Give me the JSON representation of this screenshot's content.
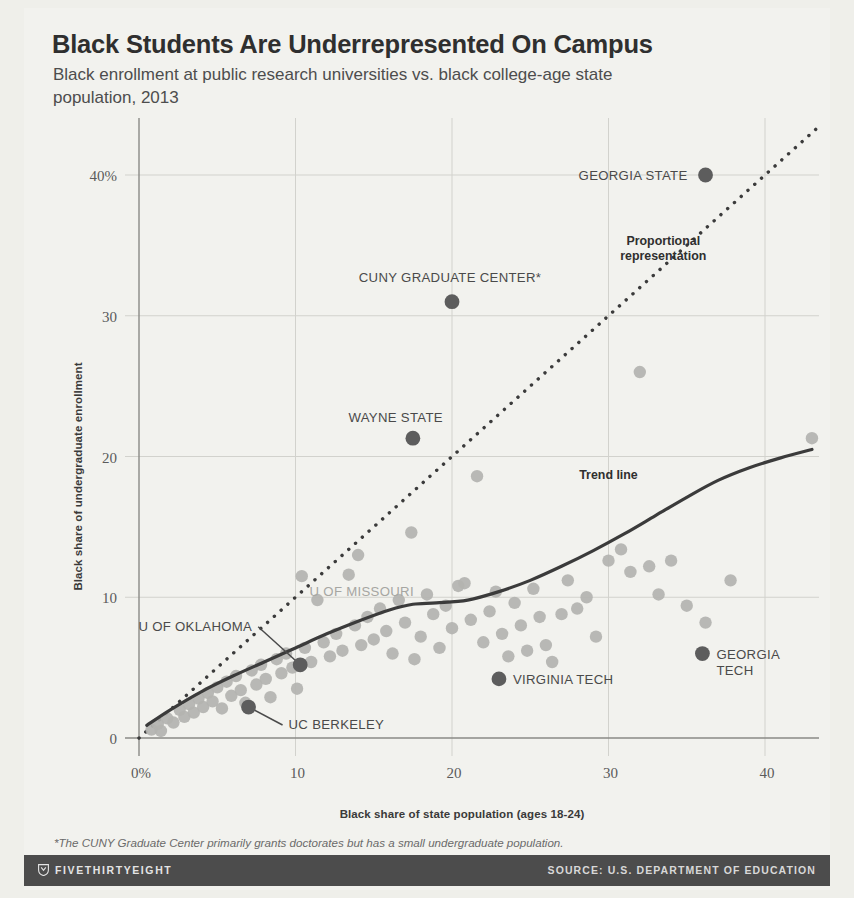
{
  "header": {
    "title": "Black Students Are Underrepresented On Campus",
    "subtitle": "Black enrollment at public research universities vs. black college-age state population, 2013"
  },
  "footnote": "*The CUNY Graduate Center primarily grants doctorates but has a small undergraduate population.",
  "footer": {
    "brand": "FIVETHIRTYEIGHT",
    "source": "SOURCE: U.S. DEPARTMENT OF EDUCATION",
    "logo_icon": "shield-icon",
    "bar_color": "#4c4c4c"
  },
  "chart_data": {
    "type": "scatter",
    "title": "Black Students Are Underrepresented On Campus",
    "subtitle": "Black enrollment at public research universities vs. black college-age state population, 2013",
    "xlabel": "Black share of state population (ages 18-24)",
    "ylabel": "Black share of undergraduate enrollment",
    "xlim": [
      0,
      45
    ],
    "ylim": [
      0,
      43
    ],
    "xticks": [
      0,
      10,
      20,
      30,
      40
    ],
    "xtick_labels": [
      "0%",
      "10",
      "20",
      "30",
      "40"
    ],
    "yticks": [
      0,
      10,
      20,
      30,
      40
    ],
    "ytick_labels": [
      "0",
      "10",
      "20",
      "30",
      "40%"
    ],
    "grid": true,
    "legend": "none",
    "colors": {
      "point": "#b3b3b0",
      "highlight": "#5d5d5d",
      "trend": "#3b3b3b",
      "reference": "#3b3b3b",
      "grid": "#d2d2cd",
      "axis": "#8a8a86",
      "background": "#f2f2ee"
    },
    "points": [
      [
        0.8,
        0.6
      ],
      [
        1.2,
        1.0
      ],
      [
        1.4,
        0.5
      ],
      [
        1.8,
        1.4
      ],
      [
        2.2,
        1.1
      ],
      [
        2.6,
        2.0
      ],
      [
        2.9,
        1.5
      ],
      [
        3.2,
        2.4
      ],
      [
        3.5,
        1.8
      ],
      [
        3.8,
        2.8
      ],
      [
        4.1,
        2.2
      ],
      [
        4.4,
        3.2
      ],
      [
        4.7,
        2.6
      ],
      [
        5.0,
        3.6
      ],
      [
        5.3,
        2.1
      ],
      [
        5.6,
        4.0
      ],
      [
        5.9,
        3.0
      ],
      [
        6.2,
        4.4
      ],
      [
        6.5,
        3.4
      ],
      [
        6.8,
        2.5
      ],
      [
        7.2,
        4.8
      ],
      [
        7.5,
        3.8
      ],
      [
        7.8,
        5.2
      ],
      [
        8.1,
        4.2
      ],
      [
        8.4,
        2.9
      ],
      [
        8.8,
        5.6
      ],
      [
        9.1,
        4.6
      ],
      [
        9.4,
        6.0
      ],
      [
        9.8,
        5.0
      ],
      [
        10.1,
        3.5
      ],
      [
        10.4,
        11.5
      ],
      [
        10.6,
        6.4
      ],
      [
        11.0,
        5.4
      ],
      [
        11.4,
        9.8
      ],
      [
        11.8,
        6.8
      ],
      [
        12.2,
        5.8
      ],
      [
        12.6,
        7.4
      ],
      [
        13.0,
        6.2
      ],
      [
        13.4,
        11.6
      ],
      [
        13.8,
        8.0
      ],
      [
        14.0,
        13.0
      ],
      [
        14.2,
        6.6
      ],
      [
        14.6,
        8.6
      ],
      [
        15.0,
        7.0
      ],
      [
        15.4,
        9.2
      ],
      [
        15.8,
        7.6
      ],
      [
        16.2,
        6.0
      ],
      [
        16.6,
        9.8
      ],
      [
        17.0,
        8.2
      ],
      [
        17.4,
        14.6
      ],
      [
        17.6,
        5.6
      ],
      [
        18.0,
        7.2
      ],
      [
        18.4,
        10.2
      ],
      [
        18.8,
        8.8
      ],
      [
        19.2,
        6.4
      ],
      [
        19.6,
        9.4
      ],
      [
        20.0,
        7.8
      ],
      [
        20.4,
        10.8
      ],
      [
        20.8,
        11.0
      ],
      [
        21.2,
        8.4
      ],
      [
        21.6,
        18.6
      ],
      [
        22.0,
        6.8
      ],
      [
        22.4,
        9.0
      ],
      [
        22.8,
        10.4
      ],
      [
        23.2,
        7.4
      ],
      [
        23.6,
        5.8
      ],
      [
        24.0,
        9.6
      ],
      [
        24.4,
        8.0
      ],
      [
        24.8,
        6.2
      ],
      [
        25.2,
        10.6
      ],
      [
        25.6,
        8.6
      ],
      [
        26.0,
        6.6
      ],
      [
        26.4,
        5.4
      ],
      [
        27.0,
        8.8
      ],
      [
        27.4,
        11.2
      ],
      [
        28.0,
        9.2
      ],
      [
        28.6,
        10.0
      ],
      [
        29.2,
        7.2
      ],
      [
        30.0,
        12.6
      ],
      [
        30.8,
        13.4
      ],
      [
        31.4,
        11.8
      ],
      [
        32.0,
        26.0
      ],
      [
        32.6,
        12.2
      ],
      [
        33.2,
        10.2
      ],
      [
        34.0,
        12.6
      ],
      [
        35.0,
        9.4
      ],
      [
        36.2,
        8.2
      ],
      [
        37.8,
        11.2
      ],
      [
        43.0,
        21.3
      ]
    ],
    "highlighted_points": [
      {
        "label": "GEORGIA STATE",
        "x": 36.2,
        "y": 40.0,
        "label_anchor": "end",
        "label_dx": -18,
        "label_dy": 5
      },
      {
        "label": "CUNY GRADUATE CENTER*",
        "x": 20.0,
        "y": 31.0,
        "label_anchor": "middle",
        "label_dx": -2,
        "label_dy": -20
      },
      {
        "label": "WAYNE STATE",
        "x": 17.5,
        "y": 21.3,
        "label_anchor": "end",
        "label_dx": 30,
        "label_dy": -16
      },
      {
        "label": "U OF OKLAHOMA",
        "x": 10.3,
        "y": 5.2,
        "label_anchor": "end",
        "label_dx": -48,
        "label_dy": -34,
        "leader": true
      },
      {
        "label": "UC BERKELEY",
        "x": 7.0,
        "y": 2.2,
        "label_anchor": "start",
        "label_dx": 40,
        "label_dy": 22,
        "leader": true
      },
      {
        "label": "VIRGINIA TECH",
        "x": 23.0,
        "y": 4.2,
        "label_anchor": "start",
        "label_dx": 14,
        "label_dy": 5
      },
      {
        "label": "GEORGIA TECH",
        "x": 36.0,
        "y": 6.0,
        "label_anchor": "start",
        "label_dx": 14,
        "label_dy": 5
      }
    ],
    "gray_labels": [
      {
        "label": "U OF MISSOURI",
        "x": 10.9,
        "y": 10.1
      }
    ],
    "annotations": [
      {
        "name": "proportional-representation",
        "text_line1": "Proportional",
        "text_line2": "representation",
        "x": 33.5,
        "y": 35.0
      },
      {
        "name": "trend-line-label",
        "text_line1": "Trend line",
        "x": 30.0,
        "y": 18.4
      }
    ],
    "reference_line": {
      "name": "Proportional representation",
      "style": "dotted",
      "from": [
        0,
        0
      ],
      "to": [
        43.5,
        43.5
      ]
    },
    "trend_line": {
      "name": "Trend line",
      "style": "solid",
      "points": [
        [
          0.5,
          0.9
        ],
        [
          2,
          2.0
        ],
        [
          4,
          3.3
        ],
        [
          6,
          4.4
        ],
        [
          8,
          5.4
        ],
        [
          10,
          6.4
        ],
        [
          12,
          7.4
        ],
        [
          14,
          8.3
        ],
        [
          16,
          9.1
        ],
        [
          17.5,
          9.5
        ],
        [
          19,
          9.6
        ],
        [
          21,
          9.8
        ],
        [
          23,
          10.4
        ],
        [
          25,
          11.2
        ],
        [
          27,
          12.2
        ],
        [
          29,
          13.3
        ],
        [
          31,
          14.5
        ],
        [
          33,
          15.8
        ],
        [
          35,
          17.1
        ],
        [
          37,
          18.3
        ],
        [
          39,
          19.2
        ],
        [
          41,
          19.9
        ],
        [
          43,
          20.5
        ]
      ]
    }
  }
}
